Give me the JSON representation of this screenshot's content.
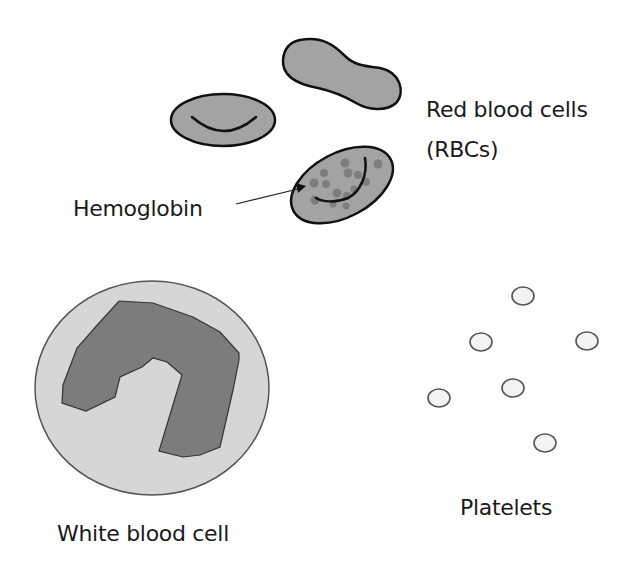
{
  "diagram": {
    "colors": {
      "background": "#ffffff",
      "rbc_fill": "#a3a3a3",
      "outline": "#111111",
      "wbc_cytoplasm": "#d6d6d6",
      "wbc_nucleus": "#7c7c7c",
      "platelet_fill": "#f3f3f3",
      "platelet_outline": "#555555",
      "hemoglobin_dots": "#7e7e7e"
    },
    "labels": {
      "rbc_line1": "Red blood cells",
      "rbc_line2": "(RBCs)",
      "hemoglobin": "Hemoglobin",
      "wbc": "White blood cell",
      "platelets": "Platelets"
    },
    "components": [
      {
        "name": "Red blood cells (RBCs)",
        "count": 3,
        "shapes": [
          "biconcave disc (side view)",
          "peanut/elongated",
          "oval with hemoglobin"
        ]
      },
      {
        "name": "Hemoglobin",
        "pointer": "arrow to dots inside oval RBC"
      },
      {
        "name": "White blood cell",
        "count": 1,
        "detail": "large circle with lobed nucleus"
      },
      {
        "name": "Platelets",
        "count": 6
      }
    ]
  }
}
